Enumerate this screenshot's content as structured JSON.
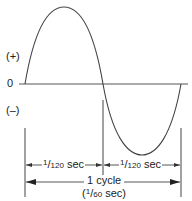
{
  "diagram": {
    "type": "AC sine wave, one cycle",
    "colors": {
      "line": "#333333",
      "text": "#222222",
      "background": "#ffffff"
    },
    "axis_labels": {
      "positive": "(+)",
      "zero": "0",
      "negative": "(–)"
    },
    "half_cycle_1": {
      "num": "1",
      "den": "120",
      "unit": " sec"
    },
    "half_cycle_2": {
      "num": "1",
      "den": "120",
      "unit": " sec"
    },
    "full_cycle": {
      "line1": "1 cycle",
      "open": "(",
      "num": "1",
      "den": "60",
      "unit": " sec)"
    }
  }
}
